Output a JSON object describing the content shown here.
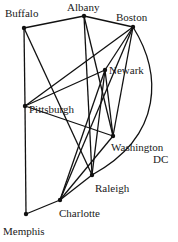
{
  "diagram": {
    "type": "graph",
    "nodes": [
      {
        "id": "buffalo",
        "label": "Buffalo",
        "x": 24,
        "y": 28
      },
      {
        "id": "albany",
        "label": "Albany",
        "x": 84,
        "y": 16
      },
      {
        "id": "boston",
        "label": "Boston",
        "x": 133,
        "y": 27
      },
      {
        "id": "newark",
        "label": "Newark",
        "x": 105,
        "y": 70
      },
      {
        "id": "pittsburgh",
        "label": "Pittsburgh",
        "x": 25,
        "y": 106
      },
      {
        "id": "washington",
        "label": "Washington",
        "label2": "DC",
        "x": 113,
        "y": 136
      },
      {
        "id": "raleigh",
        "label": "Raleigh",
        "x": 92,
        "y": 175
      },
      {
        "id": "charlotte",
        "label": "Charlotte",
        "x": 60,
        "y": 200
      },
      {
        "id": "memphis",
        "label": "Memphis",
        "x": 26,
        "y": 214
      }
    ],
    "edges": [
      [
        "buffalo",
        "albany"
      ],
      [
        "albany",
        "boston"
      ],
      [
        "buffalo",
        "pittsburgh"
      ],
      [
        "buffalo",
        "raleigh"
      ],
      [
        "albany",
        "washington"
      ],
      [
        "albany",
        "raleigh"
      ],
      [
        "boston",
        "pittsburgh"
      ],
      [
        "boston",
        "newark"
      ],
      [
        "boston",
        "washington"
      ],
      [
        "boston",
        "charlotte"
      ],
      [
        "newark",
        "pittsburgh"
      ],
      [
        "newark",
        "washington"
      ],
      [
        "newark",
        "charlotte"
      ],
      [
        "newark",
        "raleigh"
      ],
      [
        "pittsburgh",
        "washington"
      ],
      [
        "pittsburgh",
        "memphis"
      ],
      [
        "washington",
        "charlotte"
      ],
      [
        "charlotte",
        "raleigh"
      ],
      [
        "charlotte",
        "memphis"
      ]
    ],
    "curved_edges": [
      [
        "boston",
        "raleigh"
      ]
    ]
  }
}
